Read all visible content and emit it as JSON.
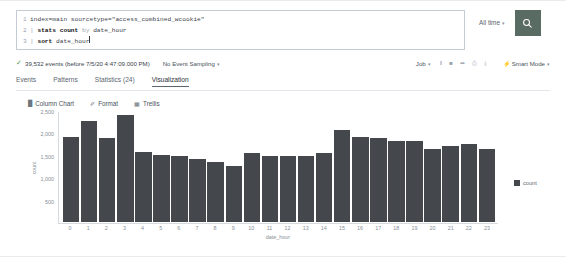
{
  "search": {
    "lines": [
      {
        "num": "1",
        "text": "index=main sourcetype=\"access_combined_wcookie\""
      },
      {
        "num": "2",
        "text": "| stats count by date_hour"
      },
      {
        "num": "3",
        "text": "| sort date_hour"
      }
    ],
    "line1_code": "index=main",
    "line1_str": " sourcetype=\"access_combined_wcookie\"",
    "line2_pipe": "| ",
    "line2_cmd": "stats count",
    "line2_kw": " by ",
    "line2_field": "date_hour",
    "line3_pipe": "| ",
    "line3_cmd": "sort",
    "line3_field": " date_hour",
    "time_range": "All time",
    "caret": "▾",
    "search_icon": "search-icon"
  },
  "results_info": {
    "check": "✓",
    "events": "39,532 events (before 7/5/20 4:47:09.000 PM)",
    "sampling": "No Event Sampling",
    "job": "Job",
    "icons": [
      "pause-icon",
      "stop-icon",
      "share-icon",
      "print-icon",
      "download-icon"
    ],
    "icon_glyphs": [
      "‖",
      "■",
      "➦",
      "⎙",
      "⤓"
    ],
    "smart_mode": "Smart Mode",
    "bolt": "⚡"
  },
  "tabs": [
    {
      "label": "Events",
      "active": false
    },
    {
      "label": "Patterns",
      "active": false
    },
    {
      "label": "Statistics (24)",
      "active": false
    },
    {
      "label": "Visualization",
      "active": true
    }
  ],
  "chart_toolbar": [
    {
      "label": "Column Chart",
      "glyph": "█",
      "icon": "column-chart-icon"
    },
    {
      "label": "Format",
      "glyph": "✐",
      "icon": "format-icon"
    },
    {
      "label": "Trellis",
      "glyph": "▦",
      "icon": "trellis-icon"
    }
  ],
  "colors": {
    "bar": "#44474b",
    "search_button": "#5a6b63",
    "accent_check": "#53a051",
    "axis": "#d5dade",
    "tick_text": "#878f97"
  },
  "chart_data": {
    "type": "bar",
    "title": "",
    "xlabel": "date_hour",
    "ylabel": "count",
    "ylim": [
      0,
      2500
    ],
    "yticks": [
      500,
      1000,
      1500,
      2000,
      2500
    ],
    "ytick_labels": [
      "500",
      "1,000",
      "1,500",
      "2,000",
      "2,500"
    ],
    "grid": false,
    "legend": [
      "count"
    ],
    "legend_position": "right",
    "categories": [
      "0",
      "1",
      "2",
      "3",
      "4",
      "5",
      "6",
      "7",
      "8",
      "9",
      "10",
      "11",
      "12",
      "13",
      "14",
      "15",
      "16",
      "17",
      "18",
      "19",
      "20",
      "21",
      "22",
      "23"
    ],
    "series": [
      {
        "name": "count",
        "values": [
          1900,
          2250,
          1880,
          2380,
          1570,
          1500,
          1480,
          1400,
          1340,
          1250,
          1530,
          1480,
          1480,
          1480,
          1530,
          2050,
          1900,
          1870,
          1800,
          1800,
          1620,
          1700,
          1750,
          1620
        ]
      }
    ]
  }
}
